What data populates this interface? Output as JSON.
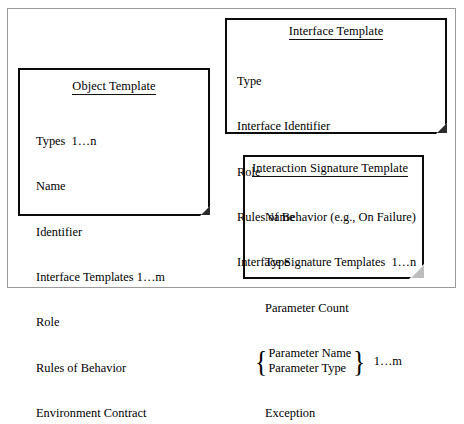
{
  "diagram": {
    "frame_color": "#9a9a9a",
    "box_border_color": "#0b0b0b",
    "fold_color": "#bdbdbd",
    "cards": [
      {
        "id": "object-template",
        "title": "Object Template",
        "fields": [
          "Types  1…n",
          "Name",
          "Identifier",
          "Interface Templates 1…m",
          "Role",
          "Rules of Behavior",
          "Environment Contract"
        ]
      },
      {
        "id": "interface-template",
        "title": "Interface Template",
        "fields": [
          "Type",
          "Interface Identifier",
          "Role",
          "Rules of Behavior (e.g., On Failure)",
          "Interface Signature Templates  1…n"
        ]
      },
      {
        "id": "interaction-signature-template",
        "title": "Interaction Signature Template",
        "fields_before": [
          "Name",
          "Type",
          "Parameter Count"
        ],
        "braced_group": {
          "rows": [
            "Parameter Name",
            "Parameter Type"
          ],
          "multiplicity": "1…m",
          "brace_left": "{",
          "brace_right": "}"
        },
        "fields_after": [
          "Exception"
        ]
      }
    ]
  }
}
